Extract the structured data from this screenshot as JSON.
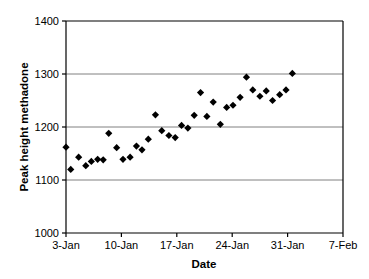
{
  "chart_data": {
    "type": "scatter",
    "title": "",
    "xlabel": "Date",
    "ylabel": "Peak height methadone",
    "ylim": [
      1000,
      1400
    ],
    "yticks": [
      1000,
      1100,
      1200,
      1300,
      1400
    ],
    "ytick_labels": [
      "1000",
      "1100",
      "1200",
      "1300",
      "1400"
    ],
    "xtick_labels": [
      "3-Jan",
      "10-Jan",
      "17-Jan",
      "24-Jan",
      "31-Jan",
      "7-Feb"
    ],
    "xtick_days": [
      0,
      7,
      14,
      21,
      28,
      35
    ],
    "xlim_days": [
      0,
      35
    ],
    "grid": "horizontal",
    "legend": "none",
    "marker": "diamond",
    "marker_color": "#000000",
    "x": [
      "3-Jan",
      "4-Jan",
      "5-Jan",
      "6-Jan",
      "7-Jan",
      "8-Jan",
      "9-Jan",
      "10-Jan",
      "11-Jan",
      "12-Jan",
      "13-Jan",
      "14-Jan",
      "15-Jan",
      "16-Jan",
      "17-Jan",
      "18-Jan",
      "19-Jan",
      "20-Jan",
      "21-Jan",
      "22-Jan",
      "23-Jan",
      "24-Jan",
      "25-Jan",
      "26-Jan",
      "27-Jan",
      "28-Jan",
      "29-Jan",
      "30-Jan",
      "31-Jan",
      "1-Feb",
      "2-Feb",
      "3-Feb",
      "4-Feb",
      "5-Feb",
      "6-Feb",
      "7-Feb"
    ],
    "x_days": [
      0,
      0.6,
      1.6,
      2.5,
      3.2,
      4,
      4.7,
      5.4,
      6.4,
      7.2,
      8.1,
      8.9,
      9.6,
      10.4,
      11.3,
      12.1,
      13,
      13.8,
      14.6,
      15.4,
      16.2,
      17,
      17.8,
      18.6,
      19.5,
      20.3,
      21.1,
      22,
      22.8,
      23.6,
      24.5,
      25.3,
      26.1,
      27,
      27.8,
      28.6
    ],
    "values": [
      1162,
      1120,
      1143,
      1127,
      1135,
      1139,
      1138,
      1188,
      1161,
      1139,
      1143,
      1164,
      1157,
      1177,
      1223,
      1193,
      1184,
      1180,
      1203,
      1198,
      1222,
      1265,
      1220,
      1247,
      1205,
      1237,
      1241,
      1256,
      1294,
      1270,
      1258,
      1268,
      1250,
      1261,
      1270,
      1301
    ]
  }
}
